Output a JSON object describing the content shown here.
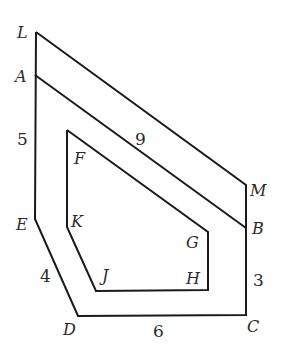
{
  "figure": {
    "vertex_labels": {
      "L": "L",
      "A": "A",
      "E": "E",
      "D": "D",
      "C": "C",
      "B": "B",
      "M": "M",
      "F": "F",
      "G": "G",
      "H": "H",
      "J": "J",
      "K": "K"
    },
    "length_labels": {
      "AE": "5",
      "AB": "9",
      "ED": "4",
      "DC": "6",
      "BC": "3"
    },
    "colors": {
      "stroke": "#1a1a1a",
      "text": "#2a2a2a",
      "background": "#ffffff"
    }
  }
}
